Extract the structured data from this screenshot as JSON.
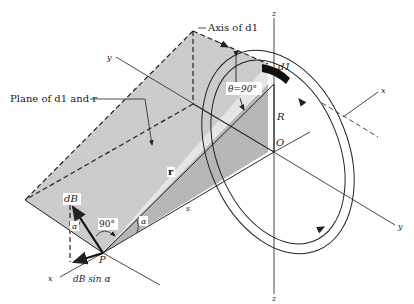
{
  "diagram": {
    "type": "physics-illustration",
    "labels": {
      "axis_of_dl": "Axis of d1",
      "plane_label": "Plane of d1 and r",
      "z_top": "z",
      "z_bottom": "z",
      "y_left": "y",
      "y_right": "y",
      "x_right": "x",
      "x_left": "x",
      "dl": "d1",
      "theta": "θ=90°",
      "R": "R",
      "O": "O",
      "r": "r",
      "s": "s",
      "alpha_1": "α",
      "alpha_2": "α",
      "right_angle": "90°",
      "dB": "dB",
      "P": "P",
      "dB_sin_alpha": "dB sin α"
    },
    "colors": {
      "line": "#222222",
      "plane_fill": "#c9c9c9",
      "triangle_fill": "#b4b4b4",
      "background": "#ffffff"
    }
  }
}
